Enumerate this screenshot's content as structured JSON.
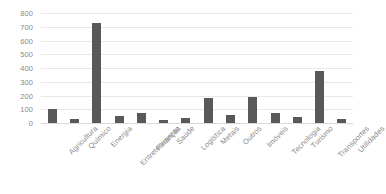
{
  "chart_data": {
    "type": "bar",
    "title": "",
    "subtitle": "",
    "xlabel": "",
    "ylabel": "",
    "ylim": [
      0,
      800
    ],
    "ytick_step": 100,
    "grid": true,
    "legend": false,
    "legend_position": "none",
    "bar_color": "#595959",
    "gridline_color": "#e8e8e8",
    "axis_text_color": "#8a8a8a",
    "background_color": "#ffffff",
    "xtick_rotation": -45,
    "categories": [
      "Agricultura",
      "Químico",
      "Energia",
      "Entretenimento",
      "Finanças",
      "Saúde",
      "Logística",
      "Metais",
      "Outros",
      "Imóveis",
      "Tecnologia",
      "Turismo",
      "Transportes",
      "Utilidades"
    ],
    "values": [
      100,
      30,
      730,
      50,
      75,
      22,
      35,
      185,
      55,
      190,
      75,
      45,
      375,
      30
    ],
    "ytick_labels": [
      "800",
      "700",
      "600",
      "500",
      "400",
      "300",
      "200",
      "100",
      "0"
    ],
    "ytick_values": [
      800,
      700,
      600,
      500,
      400,
      300,
      200,
      100,
      0
    ]
  }
}
